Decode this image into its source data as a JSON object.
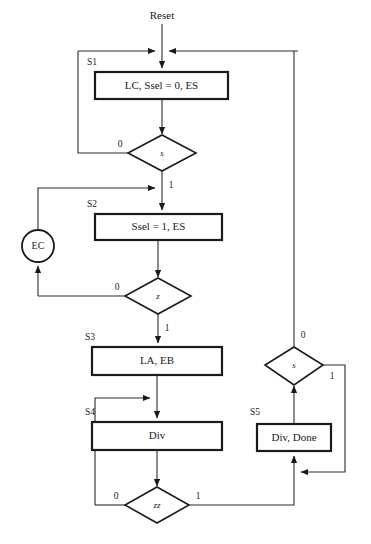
{
  "diagram": {
    "type": "asm-chart",
    "title_text": "Reset",
    "background": "#ffffff",
    "line_color": "#2b2b2b",
    "shape_stroke": "#1a1a1a",
    "states": [
      {
        "id": "S1",
        "label": "S1",
        "output": "LC, Ssel = 0, ES"
      },
      {
        "id": "S2",
        "label": "S2",
        "output": "Ssel = 1, ES"
      },
      {
        "id": "S3",
        "label": "S3",
        "output": "LA, EB"
      },
      {
        "id": "S4",
        "label": "S4",
        "output": "Div"
      },
      {
        "id": "S5",
        "label": "S5",
        "output": "Div, Done"
      }
    ],
    "decisions": [
      {
        "id": "d-s-top",
        "condition": "s",
        "branch_false": "0",
        "branch_true": "1"
      },
      {
        "id": "d-z",
        "condition": "z",
        "branch_false": "0",
        "branch_true": "1"
      },
      {
        "id": "d-zz",
        "condition": "zz",
        "branch_false": "0",
        "branch_true": "1"
      },
      {
        "id": "d-s-right",
        "condition": "s",
        "branch_false": "0",
        "branch_true": "1"
      }
    ],
    "conditional_outputs": [
      {
        "id": "EC",
        "label": "EC"
      }
    ],
    "edge_labels": {
      "s_top_zero": "0",
      "s_top_one": "1",
      "z_zero": "0",
      "z_one": "1",
      "zz_zero": "0",
      "zz_one": "1",
      "s_right_zero": "0",
      "s_right_one": "1"
    }
  }
}
